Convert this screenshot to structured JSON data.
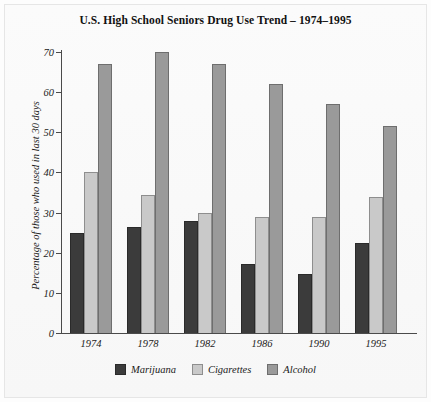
{
  "chart_data": {
    "type": "bar",
    "title": "U.S. High School Seniors Drug Use Trend – 1974–1995",
    "xlabel": "",
    "ylabel": "Percentage of those who used in last 30 days",
    "categories": [
      "1974",
      "1978",
      "1982",
      "1986",
      "1990",
      "1995"
    ],
    "series": [
      {
        "name": "Marijuana",
        "color": "#3b3b3b",
        "values": [
          25.0,
          26.5,
          28.0,
          17.2,
          14.8,
          22.5
        ]
      },
      {
        "name": "Cigarettes",
        "color": "#c9c9c9",
        "values": [
          40.0,
          34.5,
          30.0,
          29.0,
          29.0,
          34.0
        ]
      },
      {
        "name": "Alcohol",
        "color": "#9a9a9a",
        "values": [
          67.0,
          70.0,
          67.0,
          62.0,
          57.0,
          51.5
        ]
      }
    ],
    "ylim": [
      0,
      70
    ],
    "yticks": [
      0,
      10,
      20,
      30,
      40,
      50,
      60,
      70
    ],
    "ytick_labels": [
      "0",
      "10",
      "20",
      "30",
      "40",
      "50",
      "60",
      "70"
    ],
    "grid": false,
    "legend_position": "bottom-center"
  }
}
